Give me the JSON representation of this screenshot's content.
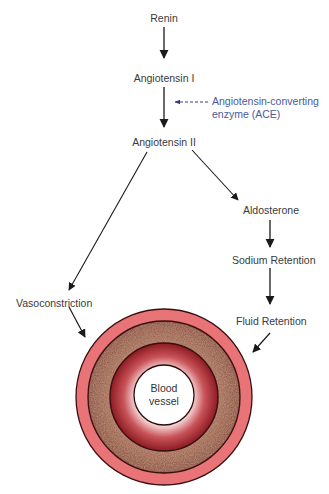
{
  "diagram": {
    "nodes": {
      "renin": "Renin",
      "angiotensin_1": "Angiotensin I",
      "angiotensin_2": "Angiotensin II",
      "aldosterone": "Aldosterone",
      "sodium_retention": "Sodium Retention",
      "fluid_retention": "Fluid Retention",
      "vasoconstriction": "Vasoconstriction"
    },
    "enzyme": {
      "line1": "Angiotensin-converting",
      "line2": "enzyme (ACE)",
      "color": "#4a5a9c"
    },
    "vessel": {
      "line1": "Blood",
      "line2": "vessel",
      "colors": {
        "outer": "#e97478",
        "media": "#a0705a",
        "intima": "#a8242c",
        "lumen": "#ffffff",
        "outline": "#3a0f10"
      }
    },
    "edges": [
      {
        "from": "Renin",
        "to": "Angiotensin I"
      },
      {
        "from": "Angiotensin I",
        "to": "Angiotensin II",
        "via": "Angiotensin-converting enzyme (ACE)"
      },
      {
        "from": "Angiotensin II",
        "to": "Vasoconstriction"
      },
      {
        "from": "Angiotensin II",
        "to": "Aldosterone"
      },
      {
        "from": "Aldosterone",
        "to": "Sodium Retention"
      },
      {
        "from": "Sodium Retention",
        "to": "Fluid Retention"
      },
      {
        "from": "Vasoconstriction",
        "to": "Blood vessel"
      },
      {
        "from": "Fluid Retention",
        "to": "Blood vessel"
      }
    ]
  }
}
